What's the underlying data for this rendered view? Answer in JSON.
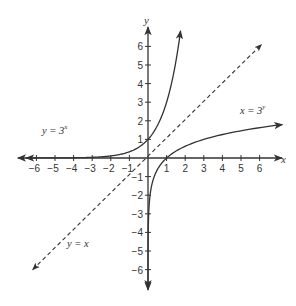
{
  "chart_data": {
    "type": "line",
    "title": "",
    "xlabel": "x",
    "ylabel": "y",
    "xlim": [
      -6.5,
      7
    ],
    "ylim": [
      -6.5,
      7
    ],
    "grid": false,
    "x_ticks": [
      -6,
      -5,
      -4,
      -3,
      -2,
      -1,
      1,
      2,
      3,
      4,
      5,
      6
    ],
    "y_ticks": [
      -6,
      -5,
      -4,
      -3,
      -2,
      -1,
      1,
      2,
      3,
      4,
      5,
      6
    ],
    "x_tick_labels": [
      "−6",
      "−5",
      "−4",
      "−3",
      "−2",
      "−1",
      "1",
      "2",
      "3",
      "4",
      "5",
      "6"
    ],
    "y_tick_labels": [
      "−6",
      "−5",
      "−4",
      "−3",
      "−2",
      "−1",
      "1",
      "2",
      "3",
      "4",
      "5",
      "6"
    ],
    "series": [
      {
        "name": "y = 3^x",
        "label_base": "y = 3",
        "label_exp": "x",
        "style": "solid",
        "points": [
          [
            -6.8,
            0.0006
          ],
          [
            -5,
            0.004
          ],
          [
            -4,
            0.012
          ],
          [
            -3,
            0.037
          ],
          [
            -2,
            0.111
          ],
          [
            -1,
            0.333
          ],
          [
            0,
            1
          ],
          [
            0.5,
            1.732
          ],
          [
            1,
            3
          ],
          [
            1.5,
            5.196
          ],
          [
            1.75,
            6.84
          ]
        ]
      },
      {
        "name": "x = 3^y",
        "label_base": "x = 3",
        "label_exp": "y",
        "style": "solid",
        "points": [
          [
            0.0006,
            -6.8
          ],
          [
            0.004,
            -5
          ],
          [
            0.012,
            -4
          ],
          [
            0.037,
            -3
          ],
          [
            0.111,
            -2
          ],
          [
            0.333,
            -1
          ],
          [
            1,
            0
          ],
          [
            1.732,
            0.5
          ],
          [
            3,
            1
          ],
          [
            5.196,
            1.5
          ],
          [
            7.2,
            1.8
          ]
        ]
      },
      {
        "name": "y = x",
        "label": "y = x",
        "style": "dashed",
        "points": [
          [
            -6.2,
            -6.0
          ],
          [
            6.1,
            6.1
          ]
        ]
      }
    ],
    "annotations": [
      {
        "text": "y = 3^x",
        "position": [
          -5.5,
          1.5
        ]
      },
      {
        "text": "x = 3^y",
        "position": [
          4.8,
          2.5
        ]
      },
      {
        "text": "y = x",
        "position": [
          -4.2,
          -4.5
        ]
      }
    ]
  },
  "labels": {
    "x_axis": "x",
    "y_axis": "y",
    "exp_label": {
      "base": "y = 3",
      "exp": "x"
    },
    "log_label": {
      "base": "x = 3",
      "exp": "y"
    },
    "line_label": "y = x"
  }
}
